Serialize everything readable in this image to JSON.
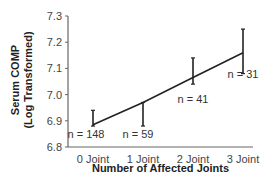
{
  "chart_data": {
    "type": "line",
    "title": "",
    "xlabel": "Number of Affected Joints",
    "ylabel_line1": "Serum COMP",
    "ylabel_line2": "(Log Transformed)",
    "categories": [
      "0 Joint",
      "1 Joint",
      "2 Joint",
      "3 Joint"
    ],
    "series": [
      {
        "name": "Serum COMP (Log Transformed)",
        "values": [
          6.885,
          6.97,
          7.065,
          7.16
        ],
        "error_low": [
          6.88,
          6.88,
          7.04,
          7.08
        ],
        "error_high": [
          6.94,
          6.97,
          7.14,
          7.25
        ]
      }
    ],
    "annotations": [
      "n = 148",
      "n = 59",
      "n = 41",
      "n = 31"
    ],
    "yticks": [
      "6.8",
      "6.9",
      "7.0",
      "7.1",
      "7.2",
      "7.3"
    ],
    "ylim": [
      6.8,
      7.3
    ],
    "grid": false,
    "legend": "none"
  }
}
